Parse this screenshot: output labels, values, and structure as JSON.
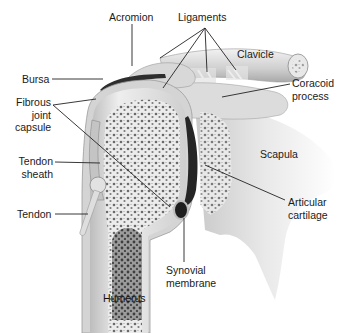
{
  "diagram": {
    "labels": {
      "acromion": "Acromion",
      "ligaments": "Ligaments",
      "clavicle": "Clavicle",
      "coracoid_line1": "Coracoid",
      "coracoid_line2": "process",
      "bursa": "Bursa",
      "fibrous_line1": "Fibrous",
      "fibrous_line2": "joint",
      "fibrous_line3": "capsule",
      "tendon_sheath_line1": "Tendon",
      "tendon_sheath_line2": "sheath",
      "tendon": "Tendon",
      "scapula": "Scapula",
      "articular_line1": "Articular",
      "articular_line2": "cartilage",
      "synovial_line1": "Synovial",
      "synovial_line2": "membrane",
      "humerus": "Humerus"
    },
    "colors": {
      "background": "#ffffff",
      "label_text": "#1a1a1a",
      "leader_line": "#222222",
      "bone_light": "#e6e6e6",
      "bone_mid": "#c8c8c8",
      "bone_dark": "#8a8a8a",
      "cartilage_dark": "#2a2a2a",
      "marrow": "#6e6e6e"
    }
  }
}
